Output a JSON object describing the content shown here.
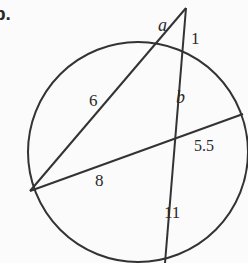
{
  "problem": {
    "part_label": "b.",
    "labels": {
      "a": "a",
      "one": "1",
      "six": "6",
      "b": "b",
      "five_five": "5.5",
      "eight": "8",
      "eleven": "11"
    }
  },
  "colors": {
    "stroke": "#333333",
    "background": "#fbfbfb"
  }
}
